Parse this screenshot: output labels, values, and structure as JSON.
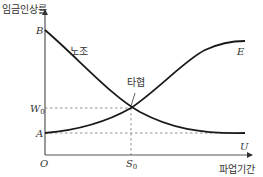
{
  "diagram": {
    "y_axis_label": "임금인상률",
    "x_axis_label": "파업기간",
    "origin_label": "O",
    "point_labels": {
      "B": "B",
      "A": "A",
      "W": "W",
      "W_sub": "0",
      "S": "S",
      "S_sub": "0",
      "E": "E",
      "U": "U"
    },
    "curve_labels": {
      "union": "노조",
      "agreement": "타협"
    },
    "colors": {
      "curve": "#1a1a1a",
      "axis": "#555555",
      "dashed": "#777777",
      "text": "#333333"
    }
  }
}
